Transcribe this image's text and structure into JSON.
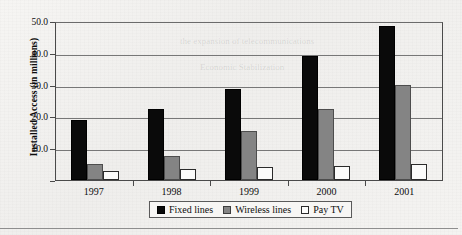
{
  "chart_data": {
    "type": "bar",
    "title": "",
    "xlabel": "",
    "ylabel": "Installed Access (in millions)",
    "categories": [
      "1997",
      "1998",
      "1999",
      "2000",
      "2001"
    ],
    "series": [
      {
        "name": "Fixed lines",
        "color": "#0a0a0a",
        "values": [
          19.0,
          22.5,
          28.5,
          39.0,
          48.5
        ]
      },
      {
        "name": "Wireless lines",
        "color": "#848484",
        "values": [
          5.0,
          7.5,
          15.5,
          22.5,
          30.0
        ]
      },
      {
        "name": "Pay TV",
        "color": "#fbfbfa",
        "values": [
          3.0,
          3.5,
          4.0,
          4.5,
          5.0
        ]
      }
    ],
    "ylim": [
      0,
      50
    ],
    "yticks": [
      10.0,
      20.0,
      30.0,
      40.0,
      50.0
    ],
    "ytick_labels": [
      "10.0",
      "20.0",
      "30.0",
      "40.0",
      "50.0"
    ],
    "grid": true,
    "legend_position": "bottom"
  },
  "legend": {
    "items": [
      {
        "label": "Fixed lines",
        "swatch": "fixed"
      },
      {
        "label": "Wireless lines",
        "swatch": "wireless"
      },
      {
        "label": "Pay TV",
        "swatch": "paytv"
      }
    ]
  },
  "background_text": {
    "items": [
      "Economic Stabilization",
      "Percent of households with access to cable TV",
      "the expansion of telecommunications"
    ]
  }
}
